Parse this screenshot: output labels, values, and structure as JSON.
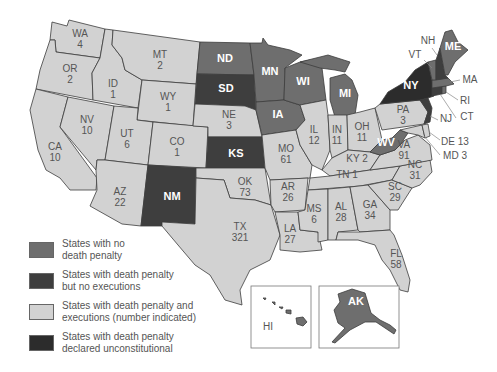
{
  "colors": {
    "no_death_penalty": "#6e6e6e",
    "no_executions": "#3e3e3e",
    "executions": "#d2d2d2",
    "unconstitutional": "#2c2c2c",
    "border": "#3c3c3c"
  },
  "legend": [
    {
      "key": "no_death_penalty",
      "label_line1": "States with no",
      "label_line2": "death penalty"
    },
    {
      "key": "no_executions",
      "label_line1": "States with death penalty",
      "label_line2": "but no executions"
    },
    {
      "key": "executions",
      "label_line1": "States with death penalty and",
      "label_line2": "executions (number indicated)"
    },
    {
      "key": "unconstitutional",
      "label_line1": "States with death penalty",
      "label_line2": "declared unconstitutional"
    }
  ],
  "states": [
    {
      "abbr": "WA",
      "category": "executions",
      "executions": "4"
    },
    {
      "abbr": "OR",
      "category": "executions",
      "executions": "2"
    },
    {
      "abbr": "CA",
      "category": "executions",
      "executions": "10"
    },
    {
      "abbr": "ID",
      "category": "executions",
      "executions": "1"
    },
    {
      "abbr": "NV",
      "category": "executions",
      "executions": "10"
    },
    {
      "abbr": "MT",
      "category": "executions",
      "executions": "2"
    },
    {
      "abbr": "WY",
      "category": "executions",
      "executions": "1"
    },
    {
      "abbr": "UT",
      "category": "executions",
      "executions": "6"
    },
    {
      "abbr": "AZ",
      "category": "executions",
      "executions": "22"
    },
    {
      "abbr": "CO",
      "category": "executions",
      "executions": "1"
    },
    {
      "abbr": "NM",
      "category": "no_executions",
      "executions": ""
    },
    {
      "abbr": "ND",
      "category": "no_death_penalty",
      "executions": ""
    },
    {
      "abbr": "SD",
      "category": "no_executions",
      "executions": ""
    },
    {
      "abbr": "NE",
      "category": "executions",
      "executions": "3"
    },
    {
      "abbr": "KS",
      "category": "no_executions",
      "executions": ""
    },
    {
      "abbr": "OK",
      "category": "executions",
      "executions": "73"
    },
    {
      "abbr": "TX",
      "category": "executions",
      "executions": "321"
    },
    {
      "abbr": "MN",
      "category": "no_death_penalty",
      "executions": ""
    },
    {
      "abbr": "IA",
      "category": "no_death_penalty",
      "executions": ""
    },
    {
      "abbr": "MO",
      "category": "executions",
      "executions": "61"
    },
    {
      "abbr": "AR",
      "category": "executions",
      "executions": "26"
    },
    {
      "abbr": "LA",
      "category": "executions",
      "executions": "27"
    },
    {
      "abbr": "WI",
      "category": "no_death_penalty",
      "executions": ""
    },
    {
      "abbr": "IL",
      "category": "executions",
      "executions": "12"
    },
    {
      "abbr": "MI",
      "category": "no_death_penalty",
      "executions": ""
    },
    {
      "abbr": "IN",
      "category": "executions",
      "executions": "11"
    },
    {
      "abbr": "OH",
      "category": "executions",
      "executions": "11"
    },
    {
      "abbr": "KY",
      "category": "executions",
      "executions": "2"
    },
    {
      "abbr": "TN",
      "category": "executions",
      "executions": "1"
    },
    {
      "abbr": "MS",
      "category": "executions",
      "executions": "6"
    },
    {
      "abbr": "AL",
      "category": "executions",
      "executions": "28"
    },
    {
      "abbr": "GA",
      "category": "executions",
      "executions": "34"
    },
    {
      "abbr": "FL",
      "category": "executions",
      "executions": "58"
    },
    {
      "abbr": "SC",
      "category": "executions",
      "executions": "29"
    },
    {
      "abbr": "NC",
      "category": "executions",
      "executions": "31"
    },
    {
      "abbr": "VA",
      "category": "executions",
      "executions": "91"
    },
    {
      "abbr": "WV",
      "category": "no_death_penalty",
      "executions": ""
    },
    {
      "abbr": "PA",
      "category": "executions",
      "executions": "3"
    },
    {
      "abbr": "NY",
      "category": "unconstitutional",
      "executions": ""
    },
    {
      "abbr": "VT",
      "category": "no_death_penalty",
      "executions": ""
    },
    {
      "abbr": "NH",
      "category": "no_executions",
      "executions": ""
    },
    {
      "abbr": "ME",
      "category": "no_death_penalty",
      "executions": ""
    },
    {
      "abbr": "MA",
      "category": "no_death_penalty",
      "executions": ""
    },
    {
      "abbr": "RI",
      "category": "no_death_penalty",
      "executions": ""
    },
    {
      "abbr": "CT",
      "category": "no_executions",
      "executions": ""
    },
    {
      "abbr": "NJ",
      "category": "no_executions",
      "executions": ""
    },
    {
      "abbr": "DE",
      "category": "executions",
      "executions": "13"
    },
    {
      "abbr": "MD",
      "category": "executions",
      "executions": "3"
    },
    {
      "abbr": "AK",
      "category": "no_death_penalty",
      "executions": ""
    },
    {
      "abbr": "HI",
      "category": "no_death_penalty",
      "executions": ""
    }
  ],
  "labels": {
    "WA": "WA",
    "OR": "OR",
    "CA": "CA",
    "ID": "ID",
    "NV": "NV",
    "MT": "MT",
    "WY": "WY",
    "UT": "UT",
    "AZ": "AZ",
    "CO": "CO",
    "NM": "NM",
    "ND": "ND",
    "SD": "SD",
    "NE": "NE",
    "KS": "KS",
    "OK": "OK",
    "TX": "TX",
    "MN": "MN",
    "IA": "IA",
    "MO": "MO",
    "AR": "AR",
    "LA": "LA",
    "WI": "WI",
    "IL": "IL",
    "MI": "MI",
    "IN": "IN",
    "OH": "OH",
    "KY": "KY 2",
    "TN": "TN 1",
    "MS": "MS",
    "AL": "AL",
    "GA": "GA",
    "FL": "FL",
    "SC": "SC",
    "NC": "NC",
    "VA": "VA",
    "WV": "WV",
    "PA": "PA",
    "NY": "NY",
    "VT": "VT",
    "NH": "NH",
    "ME": "ME",
    "MA": "MA",
    "RI": "RI",
    "CT": "CT",
    "NJ": "NJ",
    "DE": "DE 13",
    "MD": "MD 3",
    "AK": "AK",
    "HI": "HI"
  }
}
